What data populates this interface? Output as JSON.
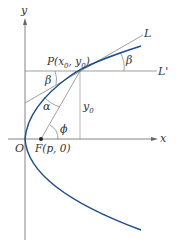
{
  "figure": {
    "axes": {
      "x_label": "x",
      "y_label": "y"
    },
    "labels": {
      "origin": "O",
      "focus": "F(p, 0)",
      "point_P": "P(x",
      "sub0a": "0",
      "comma": ", y",
      "sub0b": "0",
      "close": ")",
      "line_L": "L",
      "line_Lprime": "L'",
      "beta_left": "β",
      "beta_right": "β",
      "alpha": "α",
      "phi": "ϕ",
      "y0": "y",
      "y0_sub": "0"
    },
    "colors": {
      "curve": "#1f4e8c",
      "lines": "#555555",
      "text": "#333333"
    }
  }
}
